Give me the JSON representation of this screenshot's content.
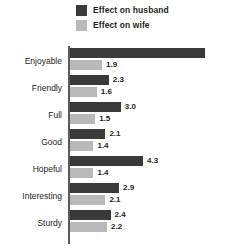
{
  "legend": {
    "position": "top",
    "items": [
      {
        "label": "Effect on husband",
        "color": "#3a3a3a",
        "icon": "legend-swatch-icon"
      },
      {
        "label": "Effect on wife",
        "color": "#b9b9b9",
        "icon": "legend-swatch-icon"
      }
    ]
  },
  "chart_data": {
    "type": "bar",
    "orientation": "horizontal",
    "title": "",
    "subtitle": "",
    "xlabel": "",
    "ylabel": "",
    "grid": false,
    "legend_position": "top",
    "xlim": [
      0,
      8.2
    ],
    "categories": [
      "Enjoyable",
      "Friendly",
      "Full",
      "Good",
      "Hopeful",
      "Interesting",
      "Sturdy"
    ],
    "series": [
      {
        "name": "Effect on husband",
        "color": "#3a3a3a",
        "values": [
          7.9,
          2.3,
          3.0,
          2.1,
          4.3,
          2.9,
          2.4
        ],
        "labels": [
          "7.9",
          "2.3",
          "3.0",
          "2.1",
          "4.3",
          "2.9",
          "2.4"
        ]
      },
      {
        "name": "Effect on wife",
        "color": "#b9b9b9",
        "values": [
          1.9,
          1.6,
          1.5,
          1.4,
          1.4,
          2.1,
          2.2
        ],
        "labels": [
          "1.9",
          "1.6",
          "1.5",
          "1.4",
          "1.4",
          "2.1",
          "2.2"
        ]
      }
    ]
  },
  "style": {
    "background": "#ffffff",
    "axis_color": "#5a5a5a",
    "text_color": "#231f20",
    "inside_label_color": "#ffffff",
    "px_per_unit": 17.1
  }
}
